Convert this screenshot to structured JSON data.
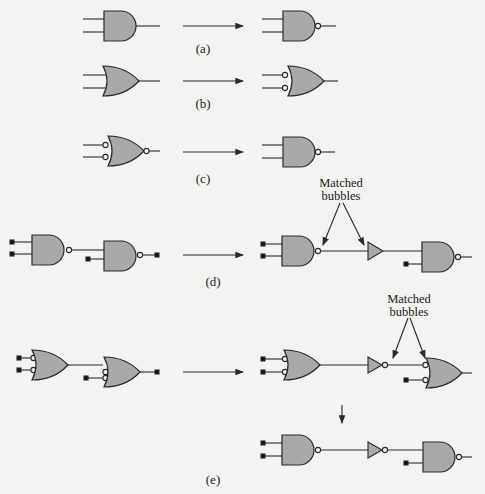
{
  "figure": {
    "panels": [
      {
        "id": "a",
        "label": "(a)",
        "from": "AND gate",
        "to": "AND gate with output bubble (NAND)"
      },
      {
        "id": "b",
        "label": "(b)",
        "from": "OR gate",
        "to": "OR gate with input bubbles"
      },
      {
        "id": "c",
        "label": "(c)",
        "from": "OR gate with input and output bubbles",
        "to": "NAND gate"
      },
      {
        "id": "d",
        "label": "(d)",
        "from": "NAND driving NAND",
        "to": "NAND, buffer, NAND",
        "annotation": "Matched bubbles"
      },
      {
        "id": "e",
        "label": "(e)",
        "from": "bubbled-input OR driving bubbled-input OR",
        "to": "OR, inverter, bubbled OR; then NAND, inverter, NAND",
        "annotation": "Matched bubbles"
      }
    ],
    "annotations": {
      "matched_line1": "Matched",
      "matched_line2": "bubbles"
    },
    "colors": {
      "gate_fill": "#a9a9a7",
      "stroke": "#2a2a2a",
      "background": "#f3f3f1"
    }
  },
  "bleed_through": {
    "heading": "Example 2.1",
    "lines": [
      "Now consider the POS expression Y = (D + B)(A + C)(A + C̄). The",
      "sum in Figure 2.49(b) is formed by replacing OR gates with NOR gates, adding",
      "ing bubbles to the input of the AND gate and adding an inverter to D using",
      "input bubble. Then the bubbles at the input to the gate ... equivalent to",
      "an equivalent NOR gate to form the circuit in Figure 2.49(c).",
      "A quick reveals that the transformed circuit is equivalent to the original"
    ]
  }
}
